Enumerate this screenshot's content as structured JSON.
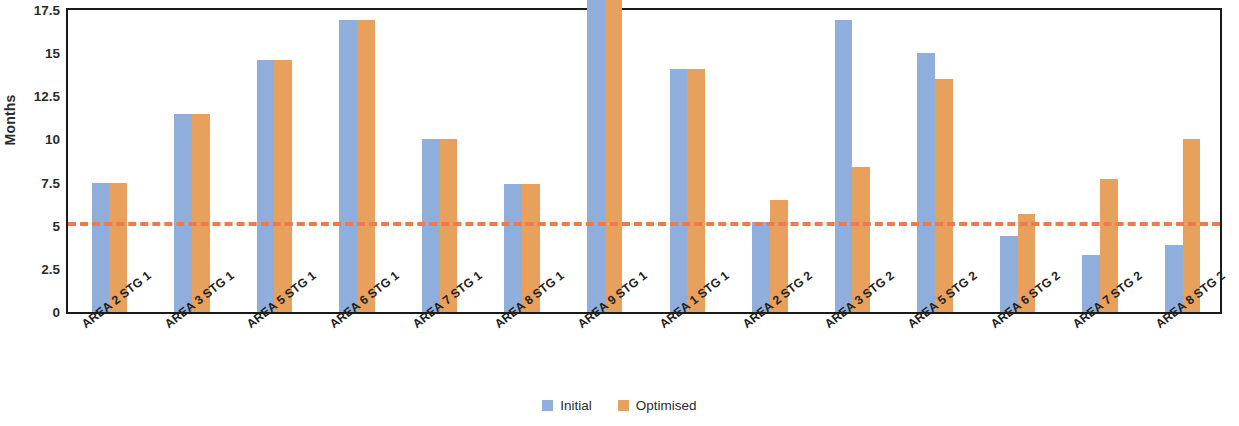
{
  "chart_data": {
    "type": "bar",
    "title": "",
    "xlabel": "",
    "ylabel": "Months",
    "ylim": [
      0,
      17.5
    ],
    "yticks": [
      0,
      2.5,
      5,
      7.5,
      10,
      12.5,
      15,
      17.5
    ],
    "ytick_labels": [
      "0",
      "2.5",
      "5",
      "7.5",
      "10",
      "12.5",
      "15",
      "17.5"
    ],
    "grid": false,
    "legend_position": "bottom-center",
    "categories": [
      "AREA 2 STG 1",
      "AREA 3 STG 1",
      "AREA 5 STG 1",
      "AREA 6 STG 1",
      "AREA 7 STG 1",
      "AREA 8 STG 1",
      "AREA 9 STG 1",
      "AREA 1 STG 1",
      "AREA 2 STG 2",
      "AREA 3 STG 2",
      "AREA 5 STG 2",
      "AREA 6 STG 2",
      "AREA 7 STG 2",
      "AREA 8 STG 2"
    ],
    "series": [
      {
        "name": "Initial",
        "color": "#8faedc",
        "values": [
          7.5,
          11.5,
          14.6,
          16.9,
          10.0,
          7.4,
          18.5,
          14.1,
          5.2,
          16.9,
          15.0,
          4.4,
          3.3,
          3.9
        ]
      },
      {
        "name": "Optimised",
        "color": "#e8a15c",
        "values": [
          7.5,
          11.5,
          14.6,
          16.9,
          10.0,
          7.4,
          18.5,
          14.1,
          6.5,
          8.4,
          13.5,
          5.7,
          7.7,
          10.0
        ]
      }
    ],
    "annotations": [
      {
        "type": "threshold-line",
        "orientation": "horizontal",
        "value": 5,
        "style": "dashed",
        "color": "#ec7a4f"
      }
    ]
  },
  "legend": {
    "items": [
      {
        "label": "Initial",
        "color": "#8faedc"
      },
      {
        "label": "Optimised",
        "color": "#e8a15c"
      }
    ]
  }
}
